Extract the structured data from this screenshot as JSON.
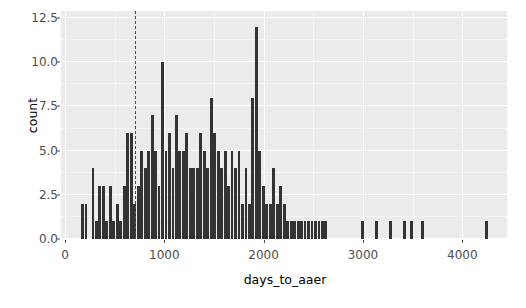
{
  "chart_data": {
    "type": "bar",
    "subtype": "histogram",
    "title": "",
    "xlabel": "days_to_aaer",
    "ylabel": "count",
    "xlim": [
      -40,
      4450
    ],
    "ylim": [
      0,
      12.9
    ],
    "grid": true,
    "legend": null,
    "binwidth": 35,
    "theme": "ggplot2-grey",
    "panel_background": "#ebebeb",
    "bar_color": "#333333",
    "gridline_color": "#ffffff",
    "xticks": [
      0,
      1000,
      2000,
      3000,
      4000
    ],
    "xtick_labels": [
      "0",
      "1000",
      "2000",
      "3000",
      "4000"
    ],
    "yticks": [
      0.0,
      2.5,
      5.0,
      7.5,
      10.0,
      12.5
    ],
    "ytick_labels": [
      "0.0",
      "2.5",
      "5.0",
      "7.5",
      "10.0",
      "12.5"
    ],
    "annotations": [
      {
        "type": "vline",
        "name": "reference-line",
        "x": 700,
        "linetype": "dashed",
        "color": "#4d4d4d"
      }
    ],
    "x": [
      180,
      215,
      285,
      320,
      355,
      390,
      425,
      460,
      495,
      530,
      565,
      600,
      635,
      670,
      705,
      740,
      775,
      810,
      845,
      880,
      915,
      950,
      985,
      1020,
      1055,
      1090,
      1125,
      1160,
      1195,
      1230,
      1265,
      1300,
      1335,
      1370,
      1405,
      1440,
      1475,
      1510,
      1545,
      1580,
      1615,
      1650,
      1685,
      1720,
      1755,
      1790,
      1825,
      1860,
      1895,
      1930,
      1965,
      2000,
      2035,
      2070,
      2105,
      2140,
      2175,
      2210,
      2245,
      2280,
      2315,
      2350,
      2385,
      2420,
      2455,
      2490,
      2525,
      2560,
      2595,
      2630,
      3000,
      3140,
      3280,
      3420,
      3490,
      3600,
      4250
    ],
    "values": [
      2,
      2,
      4,
      1,
      3,
      3,
      1,
      3,
      1,
      2,
      1,
      3,
      6,
      6,
      2,
      3,
      5,
      4,
      5,
      7,
      5,
      3,
      10,
      5,
      6,
      4,
      7,
      5,
      5,
      6,
      4,
      4,
      4,
      6,
      5,
      4,
      8,
      6,
      5,
      4,
      5,
      3,
      5,
      4,
      5,
      2,
      4,
      2,
      8,
      12,
      5,
      3,
      2,
      2,
      4,
      2,
      3,
      2,
      1,
      1,
      1,
      1,
      1,
      1,
      1,
      1,
      1,
      1,
      1,
      1,
      1,
      1,
      1,
      1,
      1,
      1,
      1
    ]
  }
}
